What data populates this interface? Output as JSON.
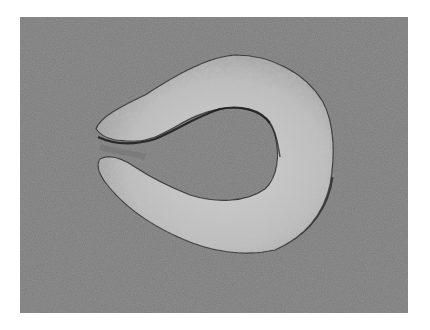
{
  "image": {
    "kind": "photograph",
    "mode": "grayscale",
    "description": "Horseshoe-shaped textured specimen on a gray background",
    "subject": "C-shaped specimen",
    "colors": {
      "page_background": "#ffffff",
      "photo_background": "#7b7b7b",
      "specimen_fill": "#bcbcbc",
      "specimen_highlight": "#d2d2d2",
      "shadow_edge": "#2a2a2a"
    }
  }
}
